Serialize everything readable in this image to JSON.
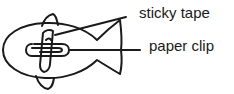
{
  "diagram": {
    "labels": {
      "sticky_tape": "sticky tape",
      "paper_clip": "paper clip"
    },
    "colors": {
      "stroke": "#1a1a1a",
      "background": "#ffffff"
    }
  }
}
